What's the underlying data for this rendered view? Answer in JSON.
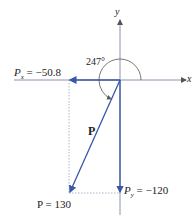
{
  "diagram": {
    "axes": {
      "x_label": "x",
      "y_label": "y"
    },
    "angle": {
      "label": "247°",
      "value_deg": 247
    },
    "vector": {
      "name": "P",
      "magnitude_label": "P = 130",
      "magnitude": 130
    },
    "components": {
      "px": {
        "symbol": "P",
        "sub": "x",
        "value_text": "= −50.8",
        "value": -50.8
      },
      "py": {
        "symbol": "P",
        "sub": "y",
        "value_text": "= −120",
        "value": -120
      }
    },
    "colors": {
      "vector": "#3a56a8",
      "axis": "#7f8aa8",
      "dotted": "#8a93b0",
      "text": "#222222"
    }
  }
}
